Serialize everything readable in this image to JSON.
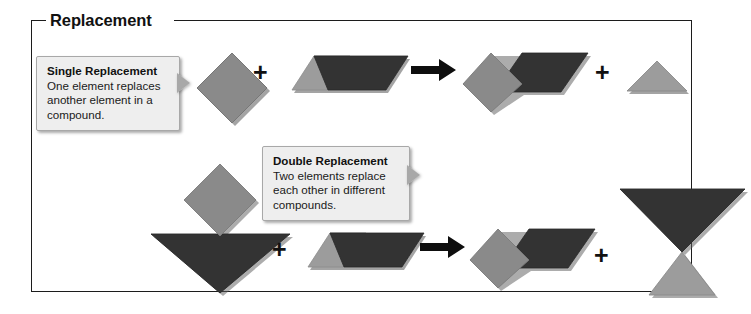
{
  "frame": {
    "legend": "Replacement"
  },
  "callouts": [
    {
      "id": "single",
      "title": "Single Replacement",
      "body": "One element replaces another element in a compound."
    },
    {
      "id": "double",
      "title": "Double Replacement",
      "body": "Two elements replace each other in different compounds."
    }
  ],
  "operators": {
    "plus": "+",
    "arrow": "arrow-right-icon"
  },
  "colors": {
    "element_gray": "#8a8a8a",
    "element_light_gray": "#9c9c9c",
    "element_dark": "#333333",
    "shadow": "#5a5a5a",
    "frame_border": "#1c1c1c",
    "callout_bg": "#eeeeee",
    "callout_border": "#a8a8a8",
    "text": "#111111"
  },
  "reactions": [
    {
      "name": "single-replacement",
      "reactants": [
        {
          "shape": "diamond",
          "color": "element_gray",
          "label": "free element (diamond)"
        },
        {
          "shape": "parallelogram-compound",
          "parts": [
            {
              "shape": "triangle-up",
              "color": "element_light_gray"
            },
            {
              "shape": "parallelogram",
              "color": "element_dark"
            }
          ],
          "label": "compound (triangle + parallelogram)"
        }
      ],
      "products": [
        {
          "shape": "diamond-parallelogram-compound",
          "parts": [
            {
              "shape": "diamond",
              "color": "element_gray"
            },
            {
              "shape": "parallelogram",
              "color": "element_dark"
            }
          ],
          "label": "new compound (diamond + parallelogram)"
        },
        {
          "shape": "triangle-up",
          "color": "element_light_gray",
          "label": "displaced element (triangle)"
        }
      ]
    },
    {
      "name": "double-replacement",
      "reactants": [
        {
          "shape": "diamond-triangle-down-compound",
          "parts": [
            {
              "shape": "diamond",
              "color": "element_gray"
            },
            {
              "shape": "triangle-down",
              "color": "element_dark"
            }
          ],
          "label": "compound (diamond + inverted triangle)"
        },
        {
          "shape": "parallelogram-compound",
          "parts": [
            {
              "shape": "triangle-up",
              "color": "element_light_gray"
            },
            {
              "shape": "parallelogram",
              "color": "element_dark"
            }
          ],
          "label": "compound (triangle + parallelogram)"
        }
      ],
      "products": [
        {
          "shape": "diamond-parallelogram-compound",
          "parts": [
            {
              "shape": "diamond",
              "color": "element_gray"
            },
            {
              "shape": "parallelogram",
              "color": "element_dark"
            }
          ],
          "label": "new compound (diamond + parallelogram)"
        },
        {
          "shape": "triangle-down-triangle-up-compound",
          "parts": [
            {
              "shape": "triangle-down",
              "color": "element_dark"
            },
            {
              "shape": "triangle-up",
              "color": "element_light_gray"
            }
          ],
          "label": "new compound (inverted triangle + triangle)"
        }
      ]
    }
  ]
}
